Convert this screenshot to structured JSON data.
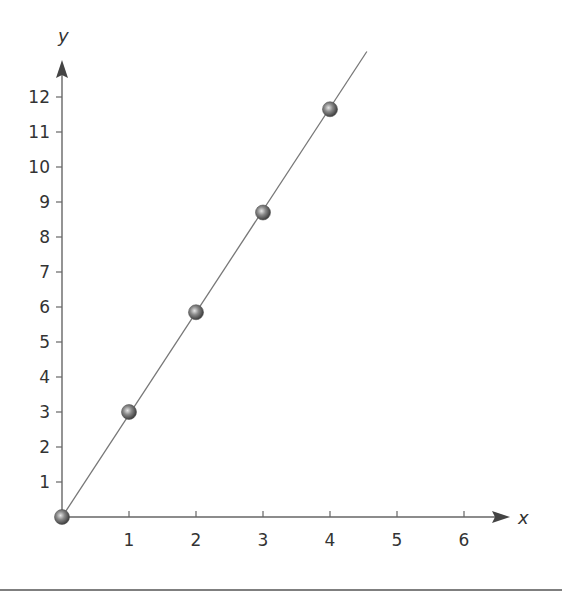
{
  "chart_data": {
    "type": "scatter",
    "title": "",
    "xlabel": "x",
    "ylabel": "y",
    "xlim": [
      0,
      6.5
    ],
    "ylim": [
      0,
      12.8
    ],
    "x_ticks": [
      1,
      2,
      3,
      4,
      5,
      6
    ],
    "y_ticks": [
      1,
      2,
      3,
      4,
      5,
      6,
      7,
      8,
      9,
      10,
      11,
      12
    ],
    "grid": false,
    "legend": null,
    "series": [
      {
        "name": "points",
        "x": [
          0,
          1,
          2,
          3,
          4
        ],
        "y": [
          0,
          3,
          5.85,
          8.7,
          11.65
        ],
        "marker": "sphere",
        "color": "#707070"
      },
      {
        "name": "best-fit line",
        "type": "line",
        "x": [
          0,
          4.55
        ],
        "y": [
          0,
          13.3
        ],
        "color": "#777777"
      }
    ]
  },
  "labels": {
    "x_axis": "x",
    "y_axis": "y"
  }
}
